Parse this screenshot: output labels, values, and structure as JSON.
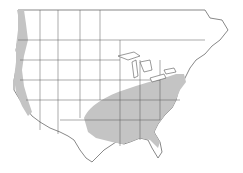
{
  "map": {
    "type": "species-range-map",
    "region": "North America (USA and southern Canada)",
    "colors": {
      "background": "#ffffff",
      "land": "#ffffff",
      "range": "#c4c4c4",
      "borders": "#555555"
    },
    "ranges": [
      {
        "name": "pacific-coast-range",
        "description": "Pacific coast strip from British Columbia to southern California"
      },
      {
        "name": "eastern-range",
        "description": "Eastern US from Texas/Oklahoma east to Atlantic coast, north to New England and Great Lakes"
      }
    ]
  }
}
